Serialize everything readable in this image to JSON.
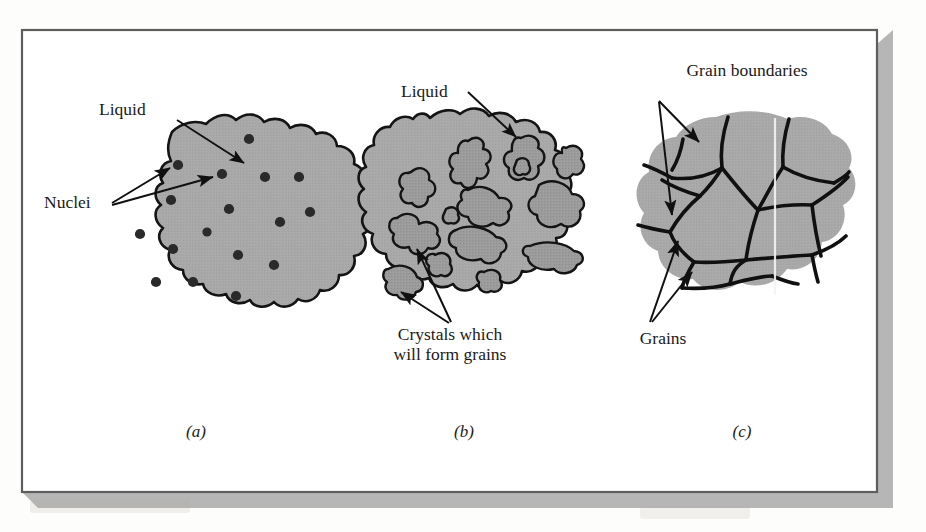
{
  "figure": {
    "type": "diagram",
    "background_color": "#fdfdfb",
    "frame_color": "#5d5d5d",
    "shadow_color": "#a9a9a9",
    "blob_fill": "#a8a8a8",
    "crystal_fill": "#9a9a9a",
    "outline_color": "#141414",
    "panels": [
      {
        "id": "a",
        "label": "(a)",
        "stage": "Nucleation in the liquid",
        "annotations": [
          {
            "text": "Liquid",
            "name": "liquid-label",
            "arrows": 1
          },
          {
            "text": "Nuclei",
            "name": "nuclei-label",
            "arrows": 2
          }
        ],
        "nuclei_count": 17
      },
      {
        "id": "b",
        "label": "(b)",
        "stage": "Crystal growth within remaining liquid",
        "annotations": [
          {
            "text": "Liquid",
            "name": "liquid-label",
            "arrows": 1
          },
          {
            "text": "Crystals which",
            "name": "crystals-label-line1",
            "arrows": 2
          },
          {
            "text": "will form grains",
            "name": "crystals-label-line2",
            "arrows": 0
          }
        ],
        "crystal_count": 14
      },
      {
        "id": "c",
        "label": "(c)",
        "stage": "Completed solidification showing grains and grain boundaries",
        "annotations": [
          {
            "text": "Grain boundaries",
            "name": "grain-boundaries-label",
            "arrows": 2
          },
          {
            "text": "Grains",
            "name": "grains-label",
            "arrows": 2
          }
        ],
        "grain_count": 13
      }
    ],
    "bleed_through_text": [
      "n",
      "t",
      "u",
      "a",
      "e",
      "o",
      "r",
      "l",
      "s",
      "i",
      "c",
      "d"
    ]
  }
}
